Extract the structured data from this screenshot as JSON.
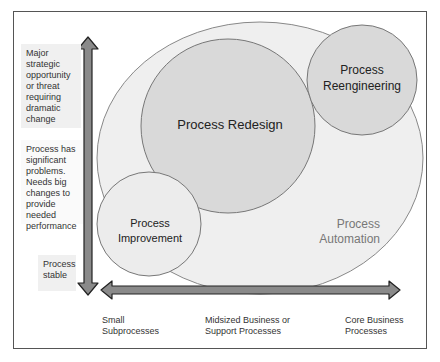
{
  "figure": {
    "circles": {
      "automation": "Process\nAutomation",
      "automation_line1": "Process",
      "automation_line2": "Automation",
      "redesign": "Process Redesign",
      "reengineering_line1": "Process",
      "reengineering_line2": "Reengineering",
      "improvement_line1": "Process",
      "improvement_line2": "Improvement"
    },
    "y_axis": {
      "top": "Major strategic opportunity or threat requiring dramatic change",
      "middle": "Process has significant problems. Needs big changes to provide needed performance",
      "bottom": "Process stable"
    },
    "x_axis": {
      "left": "Small Subprocesses",
      "middle": "Midsized Business or Support Processes",
      "right": "Core Business Processes"
    },
    "colors": {
      "outer_fill": "#efefef",
      "circle_fill": "#d9d9d9",
      "circle_stroke": "#777777",
      "arrow_fill": "#8a8a8a",
      "arrow_stroke": "#222222"
    }
  }
}
